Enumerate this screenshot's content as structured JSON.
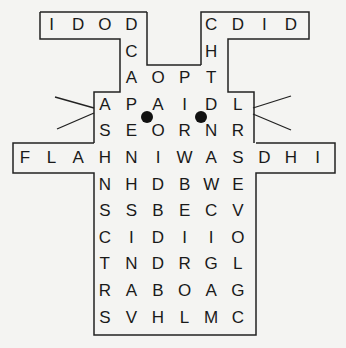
{
  "puzzle": {
    "title": "Rabbit Word Search",
    "grid_origin": {
      "x": 25,
      "y": 25
    },
    "cell_size": 26.6,
    "letters": [
      {
        "r": 0,
        "c": 1,
        "ch": "I"
      },
      {
        "r": 0,
        "c": 2,
        "ch": "D"
      },
      {
        "r": 0,
        "c": 3,
        "ch": "O"
      },
      {
        "r": 0,
        "c": 4,
        "ch": "D"
      },
      {
        "r": 0,
        "c": 7,
        "ch": "C"
      },
      {
        "r": 0,
        "c": 8,
        "ch": "D"
      },
      {
        "r": 0,
        "c": 9,
        "ch": "I"
      },
      {
        "r": 0,
        "c": 10,
        "ch": "D"
      },
      {
        "r": 1,
        "c": 4,
        "ch": "C"
      },
      {
        "r": 1,
        "c": 7,
        "ch": "H"
      },
      {
        "r": 2,
        "c": 4,
        "ch": "A"
      },
      {
        "r": 2,
        "c": 5,
        "ch": "O"
      },
      {
        "r": 2,
        "c": 6,
        "ch": "P"
      },
      {
        "r": 2,
        "c": 7,
        "ch": "T"
      },
      {
        "r": 3,
        "c": 3,
        "ch": "A"
      },
      {
        "r": 3,
        "c": 4,
        "ch": "P"
      },
      {
        "r": 3,
        "c": 5,
        "ch": "A"
      },
      {
        "r": 3,
        "c": 6,
        "ch": "I"
      },
      {
        "r": 3,
        "c": 7,
        "ch": "D"
      },
      {
        "r": 3,
        "c": 8,
        "ch": "L"
      },
      {
        "r": 4,
        "c": 3,
        "ch": "S"
      },
      {
        "r": 4,
        "c": 4,
        "ch": "E"
      },
      {
        "r": 4,
        "c": 5,
        "ch": "O"
      },
      {
        "r": 4,
        "c": 6,
        "ch": "R"
      },
      {
        "r": 4,
        "c": 7,
        "ch": "N"
      },
      {
        "r": 4,
        "c": 8,
        "ch": "R"
      },
      {
        "r": 5,
        "c": 0,
        "ch": "F"
      },
      {
        "r": 5,
        "c": 1,
        "ch": "L"
      },
      {
        "r": 5,
        "c": 2,
        "ch": "A"
      },
      {
        "r": 5,
        "c": 3,
        "ch": "H"
      },
      {
        "r": 5,
        "c": 4,
        "ch": "N"
      },
      {
        "r": 5,
        "c": 5,
        "ch": "I"
      },
      {
        "r": 5,
        "c": 6,
        "ch": "W"
      },
      {
        "r": 5,
        "c": 7,
        "ch": "A"
      },
      {
        "r": 5,
        "c": 8,
        "ch": "S"
      },
      {
        "r": 5,
        "c": 9,
        "ch": "D"
      },
      {
        "r": 5,
        "c": 10,
        "ch": "H"
      },
      {
        "r": 5,
        "c": 11,
        "ch": "I"
      },
      {
        "r": 6,
        "c": 3,
        "ch": "N"
      },
      {
        "r": 6,
        "c": 4,
        "ch": "H"
      },
      {
        "r": 6,
        "c": 5,
        "ch": "D"
      },
      {
        "r": 6,
        "c": 6,
        "ch": "B"
      },
      {
        "r": 6,
        "c": 7,
        "ch": "W"
      },
      {
        "r": 6,
        "c": 8,
        "ch": "E"
      },
      {
        "r": 7,
        "c": 3,
        "ch": "S"
      },
      {
        "r": 7,
        "c": 4,
        "ch": "S"
      },
      {
        "r": 7,
        "c": 5,
        "ch": "B"
      },
      {
        "r": 7,
        "c": 6,
        "ch": "E"
      },
      {
        "r": 7,
        "c": 7,
        "ch": "C"
      },
      {
        "r": 7,
        "c": 8,
        "ch": "V"
      },
      {
        "r": 8,
        "c": 3,
        "ch": "C"
      },
      {
        "r": 8,
        "c": 4,
        "ch": "I"
      },
      {
        "r": 8,
        "c": 5,
        "ch": "D"
      },
      {
        "r": 8,
        "c": 6,
        "ch": "I"
      },
      {
        "r": 8,
        "c": 7,
        "ch": "I"
      },
      {
        "r": 8,
        "c": 8,
        "ch": "O"
      },
      {
        "r": 9,
        "c": 3,
        "ch": "T"
      },
      {
        "r": 9,
        "c": 4,
        "ch": "N"
      },
      {
        "r": 9,
        "c": 5,
        "ch": "D"
      },
      {
        "r": 9,
        "c": 6,
        "ch": "R"
      },
      {
        "r": 9,
        "c": 7,
        "ch": "G"
      },
      {
        "r": 9,
        "c": 8,
        "ch": "L"
      },
      {
        "r": 10,
        "c": 3,
        "ch": "R"
      },
      {
        "r": 10,
        "c": 4,
        "ch": "A"
      },
      {
        "r": 10,
        "c": 5,
        "ch": "B"
      },
      {
        "r": 10,
        "c": 6,
        "ch": "O"
      },
      {
        "r": 10,
        "c": 7,
        "ch": "A"
      },
      {
        "r": 10,
        "c": 8,
        "ch": "G"
      },
      {
        "r": 11,
        "c": 3,
        "ch": "S"
      },
      {
        "r": 11,
        "c": 4,
        "ch": "V"
      },
      {
        "r": 11,
        "c": 5,
        "ch": "H"
      },
      {
        "r": 11,
        "c": 6,
        "ch": "L"
      },
      {
        "r": 11,
        "c": 7,
        "ch": "M"
      },
      {
        "r": 11,
        "c": 8,
        "ch": "C"
      }
    ],
    "colors": {
      "ink": "#1a1a1a",
      "background": "#f4f4f2",
      "outline": "#222222"
    }
  }
}
